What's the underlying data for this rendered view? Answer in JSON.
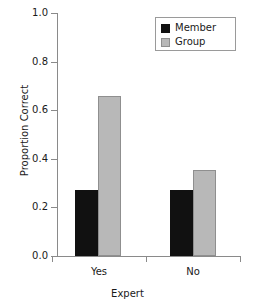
{
  "chart_data": {
    "type": "bar",
    "title": "",
    "xlabel": "Expert",
    "ylabel": "Proportion Correct",
    "categories": [
      "Yes",
      "No"
    ],
    "series": [
      {
        "name": "Member",
        "color": "#111111",
        "values": [
          0.27,
          0.27
        ]
      },
      {
        "name": "Group",
        "color": "#b8b8b8",
        "values": [
          0.66,
          0.355
        ]
      }
    ],
    "ylim": [
      0.0,
      1.0
    ],
    "ytick_labels": [
      "1.0",
      "0.8",
      "0.6",
      "0.4",
      "0.2",
      "0.0"
    ],
    "ytick_values": [
      1.0,
      0.8,
      0.6,
      0.4,
      0.2,
      0.0
    ],
    "grid": false,
    "legend_position": "top-right",
    "legend_entries": [
      "Member",
      "Group"
    ]
  },
  "axes": {
    "y_title": "Proportion Correct",
    "x_title": "Expert"
  },
  "ticks": {
    "y": [
      {
        "label": "1.0"
      },
      {
        "label": "0.8"
      },
      {
        "label": "0.6"
      },
      {
        "label": "0.4"
      },
      {
        "label": "0.2"
      },
      {
        "label": "0.0"
      }
    ],
    "x": [
      {
        "label": "Yes"
      },
      {
        "label": "No"
      }
    ]
  },
  "legend": {
    "items": [
      {
        "label": "Member",
        "swatch": "black-square-swatch"
      },
      {
        "label": "Group",
        "swatch": "gray-square-swatch"
      }
    ]
  }
}
